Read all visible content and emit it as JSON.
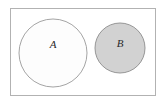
{
  "diagram": {
    "kind": "set-diagram",
    "canvas": {
      "width": 164,
      "height": 103,
      "background_color": "#ffffff"
    },
    "universe_frame": {
      "name": "universe-rectangle",
      "x": 10,
      "y": 8,
      "width": 145,
      "height": 87,
      "fill_color": "#ffffff",
      "stroke_color": "#b2b2b2",
      "stroke_width": 1
    },
    "sets": [
      {
        "label": "A",
        "name": "set-a",
        "cx": 53,
        "cy": 53,
        "r": 34,
        "fill_color": "#fdfdfd",
        "stroke_color": "#9a9a9a",
        "stroke_width": 0.9,
        "label_x": 53,
        "label_y": 45
      },
      {
        "label": "B",
        "name": "set-b",
        "cx": 120,
        "cy": 48,
        "r": 25,
        "fill_color": "#d2d2d2",
        "stroke_color": "#8c8c8c",
        "stroke_width": 0.9,
        "label_x": 120,
        "label_y": 44
      }
    ]
  }
}
